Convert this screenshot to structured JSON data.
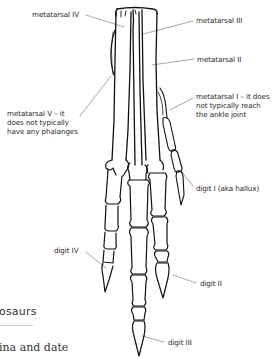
{
  "figure": {
    "labels": {
      "metatarsal_iv": "metatarsal IV",
      "metatarsal_iii": "metatarsal III",
      "metatarsal_ii": "metatarsal II",
      "metatarsal_i": "metatarsal I – it does\nnot typically reach\nthe ankle joint",
      "metatarsal_v": "metatarsal V – it\ndoes not typically\nhave any phalanges",
      "digit_i": "digit I (aka hallux)",
      "digit_iv": "digit IV",
      "digit_ii": "digit II",
      "digit_iii": "digit III"
    },
    "colors": {
      "ink": "#111111",
      "label_text": "#2a2a2a",
      "leader_line": "#6b6b6b"
    }
  },
  "page": {
    "heading_fragment": "osaurs",
    "body_fragment": "ina and date"
  }
}
